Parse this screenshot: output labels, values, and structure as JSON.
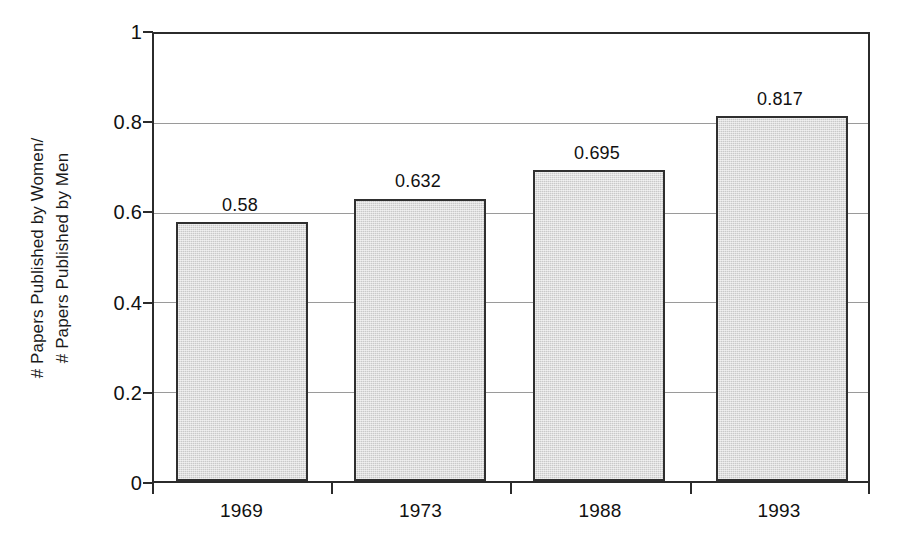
{
  "chart_data": {
    "type": "bar",
    "title": "",
    "subtitle": "",
    "xlabel": "",
    "ylabel": "# Papers Published by Women/ # Papers Published by Men",
    "ylabel_lines": [
      "# Papers Published by Women/",
      "# Papers Published by Men"
    ],
    "categories": [
      "1969",
      "1973",
      "1988",
      "1993"
    ],
    "values": [
      0.58,
      0.632,
      0.695,
      0.817
    ],
    "value_labels": [
      "0.58",
      "0.632",
      "0.695",
      "0.817"
    ],
    "ylim": [
      0,
      1
    ],
    "ytick_values": [
      0,
      0.2,
      0.4,
      0.6,
      0.8,
      1
    ],
    "ytick_labels": [
      "0",
      "0.2",
      "0.4",
      "0.6",
      "0.8",
      "1"
    ],
    "grid": "horizontal",
    "legend": "none",
    "bar_fill_color": "#c9c9c9",
    "bar_border_color": "#2f2f2f",
    "axis_color": "#2b2b2b",
    "gridline_color": "#9a9a9a",
    "background_color": "#ffffff",
    "text_color": "#111111"
  },
  "figure": {
    "caption_ghost": ""
  }
}
